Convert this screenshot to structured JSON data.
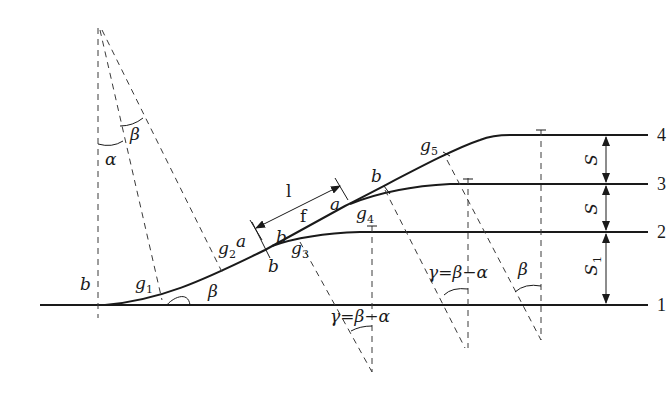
{
  "diagram": {
    "type": "railway ladder track / parallel track connection geometry",
    "track_numbers": [
      "1",
      "2",
      "3",
      "4"
    ],
    "spacing_labels": {
      "s_4_3": "S",
      "s_3_2": "S",
      "s_2_1_base": "S",
      "s_2_1_sub": "1"
    },
    "angle_labels": {
      "alpha": "α",
      "beta_top": "β",
      "beta_base": "β",
      "beta_right": "β",
      "gamma_lower": "γ=β−α",
      "gamma_upper": "γ=β−α"
    },
    "point_labels": {
      "g1": {
        "base": "g",
        "sub": "1"
      },
      "g2": {
        "base": "g",
        "sub": "2"
      },
      "g3": {
        "base": "g",
        "sub": "3"
      },
      "g4": {
        "base": "g",
        "sub": "4"
      },
      "g5": {
        "base": "g",
        "sub": "5"
      }
    },
    "segment_labels": {
      "b_left": "b",
      "a_g2": "a",
      "b_upper_g3": "b",
      "b_lower_g3": "b",
      "f": "f",
      "l": "l",
      "a_g4": "a",
      "b_g4": "b"
    },
    "colors": {
      "line": "#1a1a1a",
      "dash": "#3a3a3a",
      "background": "#ffffff"
    }
  }
}
